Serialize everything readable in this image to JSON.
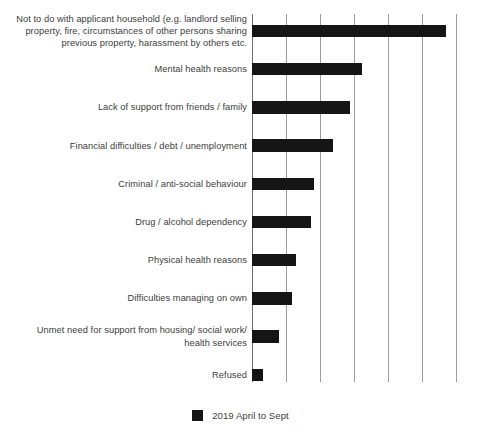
{
  "chart_data": {
    "type": "bar",
    "orientation": "horizontal",
    "title": "",
    "subtitle": "",
    "xlabel": "",
    "ylabel": "",
    "grid": true,
    "gridlines_x": [
      0,
      1,
      2,
      3,
      4,
      5,
      6
    ],
    "xlim": [
      0,
      6.2
    ],
    "legend_position": "bottom-center",
    "categories": [
      "Not to do with applicant household (e.g. landlord selling property, fire, circumstances of other persons sharing previous property, harassment by others etc.",
      "Mental health reasons",
      "Lack of support from friends / family",
      "Financial difficulties / debt / unemployment",
      "Criminal / anti-social behaviour",
      "Drug / alcohol dependency",
      "Physical health reasons",
      "Difficulties managing on own",
      "Unmet need for support from housing/ social work/ health services",
      "Refused"
    ],
    "series": [
      {
        "name": "2019 April to Sept",
        "color": "#151515",
        "values": [
          5.7,
          3.24,
          2.88,
          2.38,
          1.82,
          1.74,
          1.29,
          1.18,
          0.79,
          0.32
        ]
      }
    ]
  },
  "legend": {
    "entries": [
      {
        "label": "2019 April to Sept",
        "color": "#151515"
      }
    ]
  },
  "colors": {
    "bar": "#151515",
    "gridline": "#9c9c9c",
    "axis": "#6e6e6e",
    "text": "#3d3d3d",
    "background": "#ffffff"
  }
}
